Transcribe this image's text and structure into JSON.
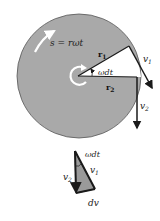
{
  "diagram": {
    "type": "rotating-disk-velocity-diagram",
    "colors": {
      "disk": "#a9a9a9",
      "lines": "#1a1a1a",
      "arc_arrow": "#ffffff",
      "wedge": "#ffffff",
      "triangle_fill": "#9a9a9a"
    },
    "labels": {
      "arc_length": "s = rωt",
      "r1": "r",
      "r1_sub": "1",
      "r2": "r",
      "r2_sub": "2",
      "angle": "ωdt",
      "v1": "v",
      "v1_sub": "1",
      "v2": "v",
      "v2_sub": "2",
      "tri_angle": "ωdt",
      "tri_v1": "v",
      "tri_v1_sub": "1",
      "tri_v2": "v",
      "tri_v2_sub": "2",
      "tri_dv": "dv"
    }
  }
}
